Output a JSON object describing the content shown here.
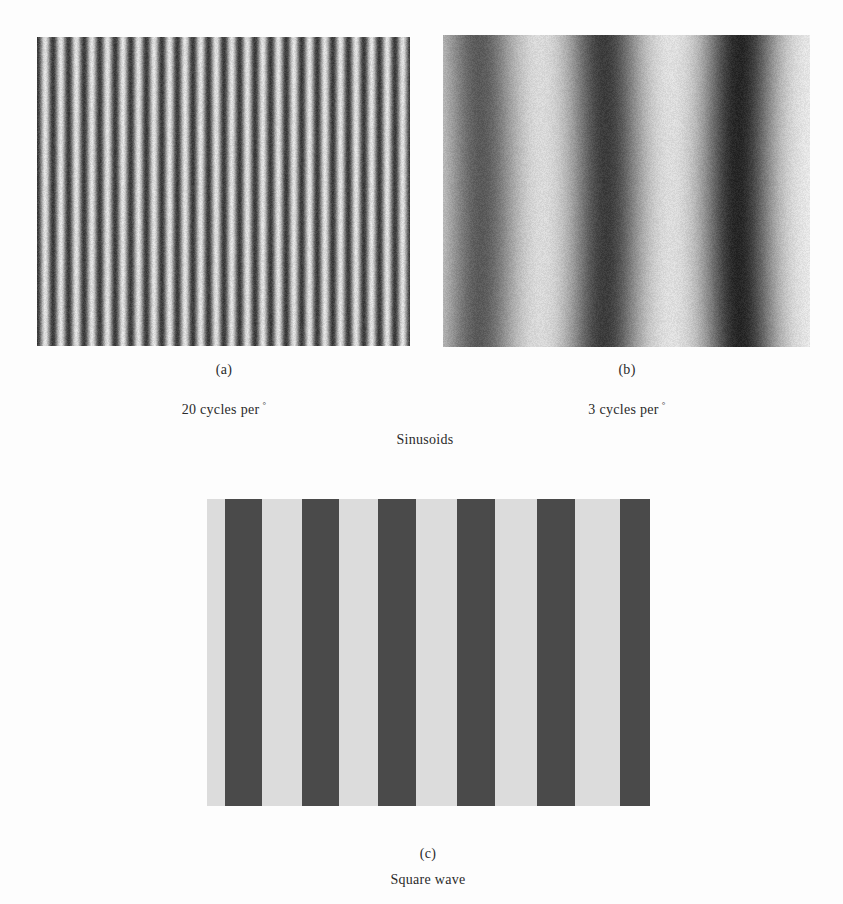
{
  "figure": {
    "group_caption": "Sinusoids",
    "panels": [
      {
        "id": "a",
        "label": "(a)",
        "caption_value": "20 cycles per",
        "caption_unit": "°",
        "type": "sinusoid",
        "periods_visible": 24,
        "period_px": 15.6,
        "phase": "dark-at-left",
        "dark_color": "#3c3c3c",
        "light_color": "#e0e0e0"
      },
      {
        "id": "b",
        "label": "(b)",
        "caption_value": "3 cycles per",
        "caption_unit": "°",
        "type": "sinusoid",
        "band_centers_px": [
          35,
          160,
          297
        ],
        "period_px": 131,
        "dark_colors": [
          "#5a5a5a",
          "#3c3c3c",
          "#262626"
        ],
        "light_color": "#ececec"
      },
      {
        "id": "c",
        "label": "(c)",
        "caption": "Square wave",
        "type": "square-wave",
        "bars_px": [
          [
            18,
            37
          ],
          [
            95,
            37
          ],
          [
            171,
            38
          ],
          [
            250,
            38
          ],
          [
            330,
            38
          ],
          [
            413,
            30
          ]
        ],
        "dark_color": "#4a4a4a",
        "light_color": "#dcdcdc"
      }
    ]
  }
}
